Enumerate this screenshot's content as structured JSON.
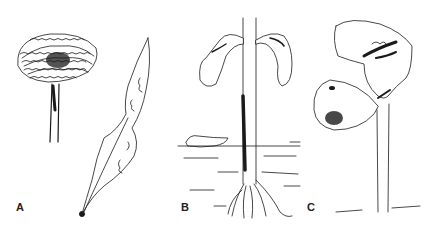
{
  "figure": {
    "panels": [
      {
        "label": "A",
        "description": "mushroom-like fungal growth on stalk and elongated infected leaf with dark tip"
      },
      {
        "label": "B",
        "description": "seedling with drooping cotyledons, dark lesion on stem at soil line, roots"
      },
      {
        "label": "C",
        "description": "seedling with two cotyledons showing dark lesions"
      }
    ],
    "colors": {
      "ink": "#1a1a1a",
      "background": "#ffffff"
    }
  }
}
